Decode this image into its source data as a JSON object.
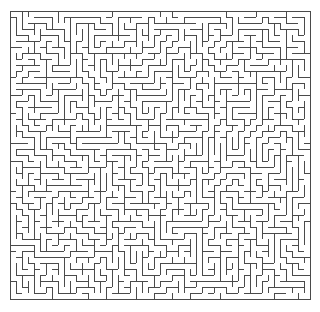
{
  "figure": {
    "kind": "maze",
    "title": "Rectangular perfect maze",
    "canvas_width": 320,
    "canvas_height": 312,
    "background_color": "#ffffff"
  },
  "maze": {
    "type": "perfect-maze",
    "algorithm": "randomized-depth-first-search",
    "seed": 20240607,
    "columns": 50,
    "rows": 48,
    "cell_size": 6,
    "origin_x": 10,
    "origin_y": 11,
    "width": 298,
    "height": 290,
    "wall_color": "#4a4a4a",
    "wall_thickness": 1,
    "passage_color": "#ffffff",
    "border_closed": true,
    "entrance": null,
    "exit": null,
    "loops": 0
  },
  "chart_data": {
    "type": "diagram",
    "title": "Rectangular perfect maze",
    "grid_columns": 50,
    "grid_rows": 48,
    "cell_size_px": 6,
    "total_cells": 2400,
    "wall_segments_estimate": 2399
  }
}
